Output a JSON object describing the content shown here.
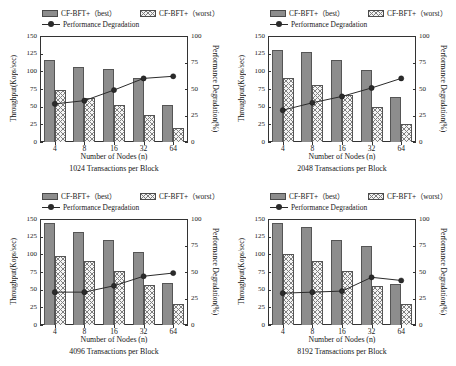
{
  "legend": {
    "best_label": "CF-BFT+（best）",
    "worst_label": "CF-BFT+（worst）",
    "degradation_label": "Performance Degradation",
    "swatch_best": "best-swatch",
    "swatch_worst": "worst-swatch",
    "swatch_line": "line-marker-swatch"
  },
  "axes": {
    "ylabel": "Throughput(Kops/sec)",
    "y2label": "Performance Degradation(%)",
    "xlabel": "Number of Nodes (n)",
    "yticks": [
      "150",
      "125",
      "100",
      "75",
      "50",
      "25",
      "0"
    ],
    "y2ticks": [
      "100",
      "75",
      "50",
      "25",
      "0"
    ],
    "xticks": [
      "4",
      "8",
      "16",
      "32",
      "64"
    ]
  },
  "colors": {
    "best_fill": "#8d8d8d",
    "worst_fill": "#f5f5f5",
    "hatch": "#808080",
    "line": "#2b2b2b",
    "axis": "#333333"
  },
  "chart_data": [
    {
      "type": "bar",
      "title": "1024 Transactions per Block",
      "caption": "1024 Transactions per Block",
      "xlabel": "Number of Nodes (n)",
      "ylabel": "Throughput(Kops/sec)",
      "y2label": "Performance Degradation(%)",
      "categories": [
        "4",
        "8",
        "16",
        "32",
        "64"
      ],
      "ylim": [
        0,
        150
      ],
      "y2lim": [
        0,
        100
      ],
      "grid": false,
      "legend_position": "top",
      "series": [
        {
          "name": "CF-BFT+（best）",
          "type": "bar",
          "axis": "left",
          "values": [
            116,
            106,
            103,
            91,
            53
          ]
        },
        {
          "name": "CF-BFT+（worst）",
          "type": "bar",
          "axis": "left",
          "values": [
            73,
            62,
            52,
            38,
            20
          ]
        },
        {
          "name": "Performance Degradation",
          "type": "line",
          "axis": "right",
          "values": [
            36,
            39,
            49,
            60,
            62
          ]
        }
      ]
    },
    {
      "type": "bar",
      "title": "2048 Transactions per Block",
      "caption": "2048 Transactions per Block",
      "xlabel": "Number of Nodes (n)",
      "ylabel": "Throughput(Kops/sec)",
      "y2label": "Performance Degradation(%)",
      "categories": [
        "4",
        "8",
        "16",
        "32",
        "64"
      ],
      "ylim": [
        0,
        150
      ],
      "y2lim": [
        0,
        100
      ],
      "grid": false,
      "legend_position": "top",
      "series": [
        {
          "name": "CF-BFT+（best）",
          "type": "bar",
          "axis": "left",
          "values": [
            130,
            127,
            116,
            102,
            64
          ]
        },
        {
          "name": "CF-BFT+（worst）",
          "type": "bar",
          "axis": "left",
          "values": [
            91,
            80,
            67,
            49,
            25
          ]
        },
        {
          "name": "Performance Degradation",
          "type": "line",
          "axis": "right",
          "values": [
            30,
            37,
            43,
            51,
            60
          ]
        }
      ]
    },
    {
      "type": "bar",
      "title": "4096 Transactions per Block",
      "caption": "4096 Transactions per Block",
      "xlabel": "Number of Nodes (n)",
      "ylabel": "Throughput(Kops/sec)",
      "y2label": "Performance Degradation(%)",
      "categories": [
        "4",
        "8",
        "16",
        "32",
        "64"
      ],
      "ylim": [
        0,
        150
      ],
      "y2lim": [
        0,
        100
      ],
      "grid": false,
      "legend_position": "top",
      "series": [
        {
          "name": "CF-BFT+（best）",
          "type": "bar",
          "axis": "left",
          "values": [
            144,
            132,
            121,
            103,
            60
          ]
        },
        {
          "name": "CF-BFT+（worst）",
          "type": "bar",
          "axis": "left",
          "values": [
            98,
            90,
            76,
            56,
            30
          ]
        },
        {
          "name": "Performance Degradation",
          "type": "line",
          "axis": "right",
          "values": [
            31,
            31,
            37,
            46,
            49
          ]
        }
      ]
    },
    {
      "type": "bar",
      "title": "8192 Transactions per Block",
      "caption": "8192 Transactions per Block",
      "xlabel": "Number of Nodes (n)",
      "ylabel": "Throughput(Kops/sec)",
      "y2label": "Performance Degradation(%)",
      "categories": [
        "4",
        "8",
        "16",
        "32",
        "64"
      ],
      "ylim": [
        0,
        150
      ],
      "y2lim": [
        0,
        100
      ],
      "grid": false,
      "legend_position": "top",
      "series": [
        {
          "name": "CF-BFT+（best）",
          "type": "bar",
          "axis": "left",
          "values": [
            144,
            138,
            121,
            112,
            58
          ]
        },
        {
          "name": "CF-BFT+（worst）",
          "type": "bar",
          "axis": "left",
          "values": [
            101,
            90,
            76,
            55,
            30
          ]
        },
        {
          "name": "Performance Degradation",
          "type": "line",
          "axis": "right",
          "values": [
            30,
            31,
            32,
            45,
            42
          ]
        }
      ]
    }
  ]
}
